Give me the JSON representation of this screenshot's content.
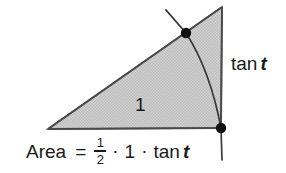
{
  "figure": {
    "labels": {
      "side_one": "1",
      "tangent_side": {
        "fn": "tan",
        "var": "t"
      },
      "area_formula": {
        "word": "Area",
        "equals": "=",
        "fraction": {
          "numerator": "1",
          "denominator": "2"
        },
        "dot1": "·",
        "one": "1",
        "dot2": "·",
        "fn": "tan",
        "var": "t"
      }
    },
    "colors": {
      "background": "#ffffff",
      "fill": "#c9c9c9",
      "stroke": "#4a4a4a",
      "text": "#1a1a1a",
      "point": "#111111"
    },
    "geometry": {
      "vertex_left": [
        48,
        129
      ],
      "vertex_top_right": [
        222,
        7
      ],
      "vertex_bottom_right": [
        221,
        128
      ],
      "point_on_hypotenuse": [
        186,
        33
      ],
      "point_on_base_right": [
        221,
        128
      ],
      "arc_start": [
        186,
        33
      ],
      "arc_end": [
        222,
        160
      ],
      "radius_tick_start": [
        166,
        10
      ],
      "radius_tick_end": [
        186,
        33
      ]
    }
  }
}
